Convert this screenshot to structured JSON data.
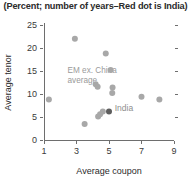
{
  "chart_data": {
    "type": "scatter",
    "title": "(Percent; number of years–Red dot is India)",
    "xlabel": "Average coupon",
    "ylabel": "Average tenor",
    "xlim": [
      1,
      9
    ],
    "ylim": [
      0,
      25
    ],
    "xticks": [
      "1",
      "3",
      "5",
      "7",
      "9"
    ],
    "yticks": [
      "0",
      "5",
      "10",
      "15",
      "20",
      "25"
    ],
    "grid": false,
    "legend": "none",
    "series": [
      {
        "name": "EM ex. China",
        "color": "#a8a8a8",
        "points": [
          {
            "x": 1.3,
            "y": 8.8
          },
          {
            "x": 2.9,
            "y": 22.0
          },
          {
            "x": 3.5,
            "y": 3.5
          },
          {
            "x": 4.18,
            "y": 12.1
          },
          {
            "x": 4.3,
            "y": 11.6
          },
          {
            "x": 4.33,
            "y": 5.1
          },
          {
            "x": 4.45,
            "y": 5.6
          },
          {
            "x": 4.62,
            "y": 6.2
          },
          {
            "x": 4.8,
            "y": 18.8
          },
          {
            "x": 5.1,
            "y": 15.2
          },
          {
            "x": 5.22,
            "y": 11.4
          },
          {
            "x": 5.2,
            "y": 10.2
          },
          {
            "x": 7.0,
            "y": 9.4
          },
          {
            "x": 8.1,
            "y": 8.8
          }
        ]
      },
      {
        "name": "India",
        "color": "#5e5e5e",
        "points": [
          {
            "x": 5.0,
            "y": 6.2
          }
        ]
      }
    ],
    "annotations": [
      {
        "id": "em-average",
        "lines": [
          "EM ex. China",
          "average"
        ],
        "x": 2.45,
        "y": 14.6
      },
      {
        "id": "india-label",
        "lines": [
          "India"
        ],
        "x": 5.35,
        "y": 6.2
      }
    ]
  }
}
